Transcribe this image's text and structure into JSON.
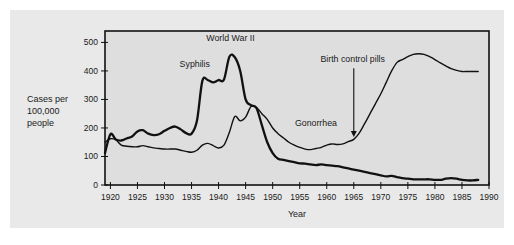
{
  "figure": {
    "background_color": "#e9e9e9",
    "plot_background_color": "#dedede",
    "line_color": "#111111"
  },
  "chart_data": {
    "type": "line",
    "title": "",
    "xlabel": "Year",
    "ylabel": "Cases per\n100,000\npeople",
    "ylabel_lines": [
      "Cases per",
      "100,000",
      "people"
    ],
    "xlim": [
      1919,
      1990
    ],
    "ylim": [
      0,
      540
    ],
    "yticks": [
      0,
      100,
      200,
      300,
      400,
      500
    ],
    "ytick_labels": [
      "0",
      "100",
      "200",
      "300",
      "400",
      "500"
    ],
    "xticks": [
      1920,
      1925,
      1930,
      1935,
      1940,
      1945,
      1950,
      1955,
      1960,
      1965,
      1970,
      1975,
      1980,
      1985,
      1990
    ],
    "xtick_labels": [
      "1920",
      "1925",
      "1930",
      "1935",
      "1940",
      "1945",
      "1950",
      "1955",
      "1960",
      "1965",
      "1970",
      "1975",
      "1980",
      "1985",
      "1990"
    ],
    "grid": false,
    "legend": "inline-annotations",
    "series": [
      {
        "name": "Syphilis",
        "stroke_width": 2.3,
        "x": [
          1919,
          1920,
          1921,
          1922,
          1923,
          1924,
          1925,
          1926,
          1927,
          1928,
          1929,
          1930,
          1931,
          1932,
          1933,
          1934,
          1935,
          1936,
          1937,
          1938,
          1939,
          1940,
          1941,
          1942,
          1943,
          1944,
          1945,
          1946,
          1947,
          1948,
          1949,
          1950,
          1951,
          1952,
          1953,
          1954,
          1955,
          1956,
          1957,
          1958,
          1959,
          1960,
          1961,
          1962,
          1963,
          1964,
          1965,
          1966,
          1967,
          1968,
          1969,
          1970,
          1971,
          1972,
          1973,
          1974,
          1975,
          1976,
          1977,
          1978,
          1979,
          1980,
          1981,
          1982,
          1983,
          1984,
          1985,
          1986,
          1987,
          1988
        ],
        "values": [
          112,
          178,
          160,
          156,
          163,
          170,
          188,
          192,
          180,
          175,
          178,
          190,
          200,
          205,
          195,
          182,
          180,
          225,
          365,
          368,
          360,
          368,
          370,
          450,
          448,
          400,
          300,
          280,
          270,
          210,
          150,
          112,
          92,
          88,
          84,
          80,
          76,
          75,
          72,
          70,
          72,
          70,
          68,
          66,
          62,
          58,
          54,
          50,
          46,
          42,
          38,
          34,
          30,
          32,
          28,
          24,
          22,
          20,
          20,
          20,
          20,
          18,
          18,
          22,
          24,
          22,
          18,
          16,
          16,
          18
        ]
      },
      {
        "name": "Gonorrhea",
        "stroke_width": 1.4,
        "x": [
          1919,
          1920,
          1921,
          1922,
          1923,
          1924,
          1925,
          1926,
          1927,
          1928,
          1929,
          1930,
          1931,
          1932,
          1933,
          1934,
          1935,
          1936,
          1937,
          1938,
          1939,
          1940,
          1941,
          1942,
          1943,
          1944,
          1945,
          1946,
          1947,
          1948,
          1949,
          1950,
          1951,
          1952,
          1953,
          1954,
          1955,
          1956,
          1957,
          1958,
          1959,
          1960,
          1961,
          1962,
          1963,
          1964,
          1965,
          1966,
          1967,
          1968,
          1969,
          1970,
          1971,
          1972,
          1973,
          1974,
          1975,
          1976,
          1977,
          1978,
          1979,
          1980,
          1981,
          1982,
          1983,
          1984,
          1985,
          1986,
          1987,
          1988
        ],
        "values": [
          150,
          162,
          158,
          140,
          136,
          134,
          134,
          138,
          134,
          130,
          128,
          126,
          126,
          126,
          122,
          118,
          115,
          122,
          140,
          146,
          138,
          130,
          140,
          185,
          240,
          225,
          238,
          275,
          272,
          250,
          230,
          200,
          180,
          165,
          150,
          140,
          132,
          126,
          124,
          128,
          132,
          140,
          144,
          142,
          144,
          152,
          160,
          182,
          215,
          250,
          285,
          320,
          360,
          400,
          430,
          440,
          450,
          458,
          460,
          458,
          450,
          440,
          428,
          418,
          408,
          402,
          398,
          398,
          398,
          398
        ]
      }
    ],
    "annotations": [
      {
        "text": "World War II",
        "x": 1942.2,
        "y": 505,
        "type": "label"
      },
      {
        "text": "Syphilis",
        "x": 1935.6,
        "y": 415,
        "type": "label"
      },
      {
        "text": "Gonorrhea",
        "x": 1958.0,
        "y": 208,
        "type": "label"
      },
      {
        "text": "Birth control pills",
        "x": 1964.8,
        "y": 430,
        "type": "label-with-arrow",
        "arrow_to_x": 1965.0,
        "arrow_to_y": 168
      }
    ]
  }
}
